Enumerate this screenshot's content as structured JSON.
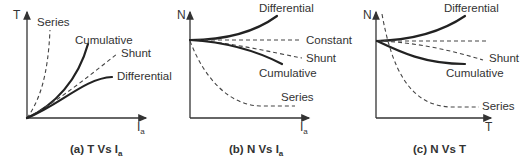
{
  "figure": {
    "panels": [
      {
        "id": "a",
        "caption_prefix": "(a) T Vs I",
        "caption_sub": "a",
        "y_axis_label": "T",
        "x_axis_label": "I",
        "x_axis_sub": "a",
        "curves": {
          "series": "Series",
          "cumulative": "Cumulative",
          "shunt": "Shunt",
          "differential": "Differential"
        }
      },
      {
        "id": "b",
        "caption_prefix": "(b) N Vs I",
        "caption_sub": "a",
        "y_axis_label": "N",
        "x_axis_label": "I",
        "x_axis_sub": "a",
        "curves": {
          "differential": "Differential",
          "constant": "Constant",
          "shunt": "Shunt",
          "cumulative": "Cumulative",
          "series": "Series"
        }
      },
      {
        "id": "c",
        "caption_prefix": "(c) N Vs T",
        "caption_sub": "",
        "y_axis_label": "N",
        "x_axis_label": "T",
        "x_axis_sub": "",
        "curves": {
          "differential": "Differential",
          "shunt": "Shunt",
          "cumulative": "Cumulative",
          "series": "Series"
        }
      }
    ],
    "line_styles": {
      "solid_color": "#222222",
      "dashed_color": "#444444"
    }
  }
}
